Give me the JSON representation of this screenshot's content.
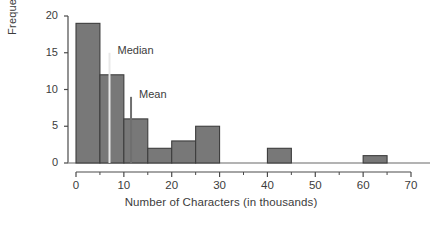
{
  "chart_data": {
    "type": "bar",
    "title": "",
    "xlabel": "Number of Characters (in thousands)",
    "ylabel": "Frequency",
    "xlim": [
      0,
      70
    ],
    "ylim": [
      0,
      20
    ],
    "grid": false,
    "legend": "none",
    "bin_width": 5,
    "categories": [
      "0-5",
      "5-10",
      "10-15",
      "15-20",
      "20-25",
      "25-30",
      "30-35",
      "35-40",
      "40-45",
      "45-50",
      "50-55",
      "55-60",
      "60-65",
      "65-70"
    ],
    "bin_starts": [
      0,
      5,
      10,
      15,
      20,
      25,
      30,
      35,
      40,
      45,
      50,
      55,
      60,
      65
    ],
    "values": [
      19,
      12,
      6,
      2,
      3,
      5,
      0,
      0,
      2,
      0,
      0,
      0,
      1,
      0
    ],
    "x_ticks": [
      0,
      10,
      20,
      30,
      40,
      50,
      60,
      70
    ],
    "x_tick_labels": [
      "0",
      "10",
      "20",
      "30",
      "40",
      "50",
      "60",
      "70"
    ],
    "x_minor_ticks": [
      5,
      15,
      25,
      35,
      45,
      55,
      65
    ],
    "y_ticks": [
      0,
      5,
      10,
      15,
      20
    ],
    "y_tick_labels": [
      "0",
      "5",
      "10",
      "15",
      "20"
    ],
    "annotations": [
      {
        "name": "median",
        "label": "Median",
        "x": 7.0,
        "y_top": 15.0,
        "color": "#e8e8e8"
      },
      {
        "name": "mean",
        "label": "Mean",
        "x": 11.5,
        "y_top": 9.0,
        "color": "#6f6f6f"
      }
    ],
    "colors": {
      "bar_fill": "#787878",
      "bar_edge": "#3d3d3d",
      "axis": "#4a4a4a",
      "text": "#3c3c3c",
      "background": "#ffffff"
    }
  }
}
